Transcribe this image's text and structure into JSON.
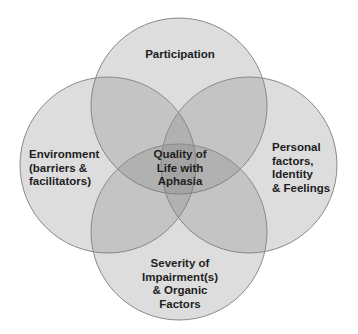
{
  "diagram": {
    "type": "venn",
    "circles": [
      {
        "id": "top",
        "label": "Participation",
        "cx": 179,
        "cy": 106,
        "r": 88
      },
      {
        "id": "left",
        "label": "Environment\n(barriers &\nfacilitators)",
        "cx": 108,
        "cy": 165,
        "r": 88
      },
      {
        "id": "right",
        "label": "Personal\nfactors,\nIdentity\n& Feelings",
        "cx": 249,
        "cy": 165,
        "r": 88
      },
      {
        "id": "bottom",
        "label": "Severity of\nImpairment(s)\n& Organic\nFactors",
        "cx": 179,
        "cy": 232,
        "r": 88
      }
    ],
    "center_label": "Quality of\nLife with\nAphasia",
    "colors": {
      "fill": "#7a7a7a",
      "stroke": "#8a8a8a",
      "text": "#1e1e1e",
      "background": "#ffffff"
    }
  }
}
